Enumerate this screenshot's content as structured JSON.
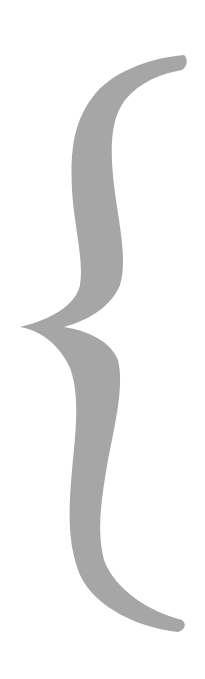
{
  "figure": {
    "glyph": "{",
    "fill_color": "#a6a6a6",
    "background_color": "#ffffff"
  }
}
